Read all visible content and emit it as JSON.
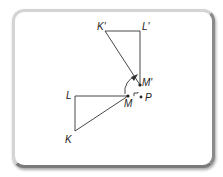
{
  "diagram": {
    "labels": {
      "K_prime": "K'",
      "L_prime": "L'",
      "M_prime": "M'",
      "L": "L",
      "M": "M",
      "K": "K",
      "P": "P"
    },
    "colors": {
      "line": "#333333",
      "frame": "#9a9a9a"
    }
  }
}
